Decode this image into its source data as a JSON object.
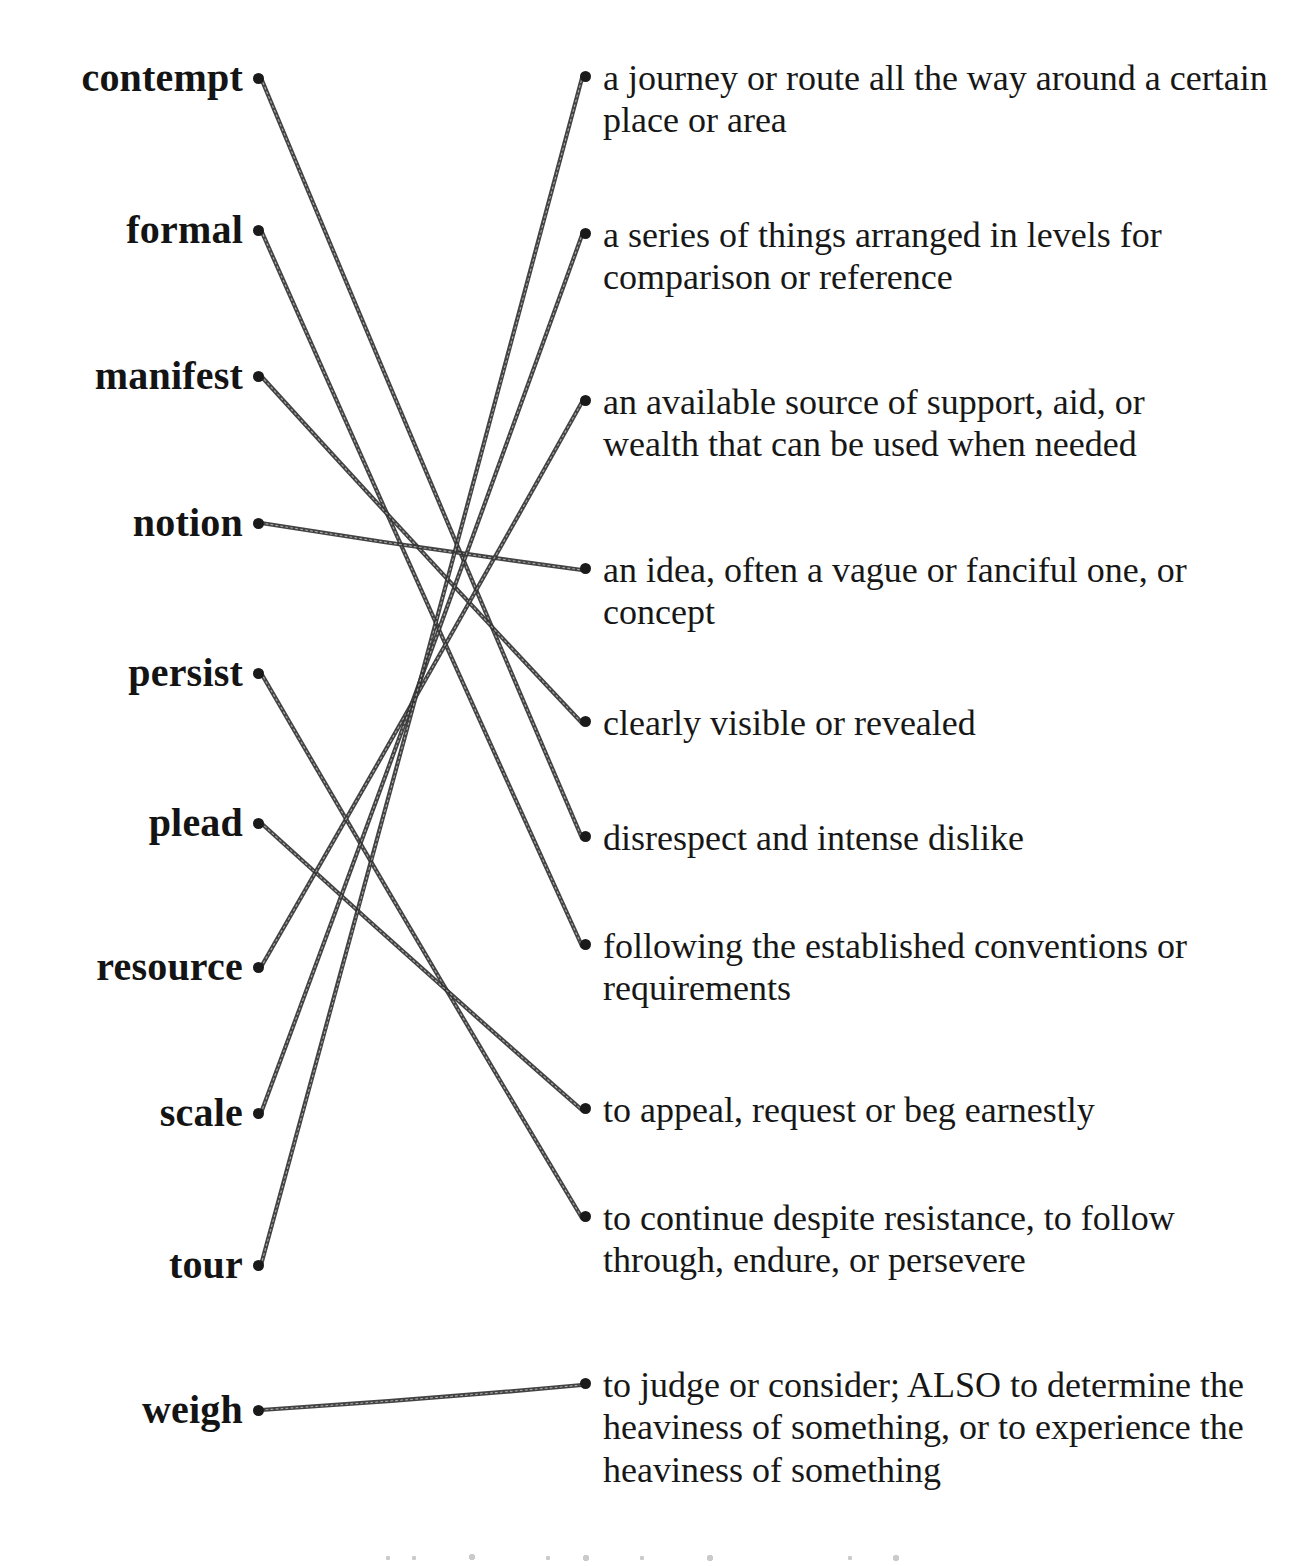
{
  "worksheet": {
    "type": "vocabulary-matching-exercise",
    "word_column_dot_x": 258,
    "definition_column_dot_x": 585,
    "words": [
      {
        "label": "contempt",
        "dot_y": 78
      },
      {
        "label": "formal",
        "dot_y": 230
      },
      {
        "label": "manifest",
        "dot_y": 376
      },
      {
        "label": "notion",
        "dot_y": 523
      },
      {
        "label": "persist",
        "dot_y": 673
      },
      {
        "label": "plead",
        "dot_y": 823
      },
      {
        "label": "resource",
        "dot_y": 967
      },
      {
        "label": "scale",
        "dot_y": 1113
      },
      {
        "label": "tour",
        "dot_y": 1265
      },
      {
        "label": "weigh",
        "dot_y": 1410
      }
    ],
    "definitions": [
      {
        "text": "a journey or route all the way around a certain place or area",
        "dot_y": 78,
        "width": 700
      },
      {
        "text": "a series of things arranged in levels for comparison or reference",
        "dot_y": 235,
        "width": 680
      },
      {
        "text": "an available source of support, aid, or wealth that can be used when needed",
        "dot_y": 402,
        "width": 660
      },
      {
        "text": "an idea, often a vague or fanciful one, or concept",
        "dot_y": 570,
        "width": 670
      },
      {
        "text": "clearly visible or revealed",
        "dot_y": 723,
        "width": 700
      },
      {
        "text": "disrespect and intense dislike",
        "dot_y": 838,
        "width": 700
      },
      {
        "text": "following the established conventions or requirements",
        "dot_y": 946,
        "width": 690
      },
      {
        "text": "to appeal, request or beg earnestly",
        "dot_y": 1110,
        "width": 700
      },
      {
        "text": "to continue despite resistance, to follow through, endure, or persevere",
        "dot_y": 1218,
        "width": 700
      },
      {
        "text": "to judge or consider; ALSO to determine the heaviness of something, or to experience the heaviness of something",
        "dot_y": 1385,
        "width": 700
      }
    ],
    "connections": [
      {
        "word": "contempt",
        "definition": "disrespect and intense dislike",
        "from_y": 78,
        "to_y": 838
      },
      {
        "word": "formal",
        "definition": "following the established conventions or requirements",
        "from_y": 230,
        "to_y": 946
      },
      {
        "word": "manifest",
        "definition": "clearly visible or revealed",
        "from_y": 376,
        "to_y": 723
      },
      {
        "word": "notion",
        "definition": "an idea, often a vague or fanciful one, or concept",
        "from_y": 523,
        "to_y": 570
      },
      {
        "word": "persist",
        "definition": "to continue despite resistance, to follow through, endure, or persevere",
        "from_y": 673,
        "to_y": 1218
      },
      {
        "word": "plead",
        "definition": "to appeal, request or beg earnestly",
        "from_y": 823,
        "to_y": 1110
      },
      {
        "word": "resource",
        "definition": "an available source of support, aid, or wealth that can be used when needed",
        "from_y": 967,
        "to_y": 402
      },
      {
        "word": "scale",
        "definition": "a series of things arranged in levels for comparison or reference",
        "from_y": 1113,
        "to_y": 235
      },
      {
        "word": "tour",
        "definition": "a journey or route all the way around a certain place or area",
        "from_y": 1265,
        "to_y": 78
      },
      {
        "word": "weigh",
        "definition": "to judge or consider; ALSO to determine the heaviness of something, or to experience the heaviness of something",
        "from_y": 1410,
        "to_y": 1385
      }
    ],
    "colors": {
      "page_background": "#ffffff",
      "ink": "#1a1a1a",
      "line": "#333333"
    }
  }
}
